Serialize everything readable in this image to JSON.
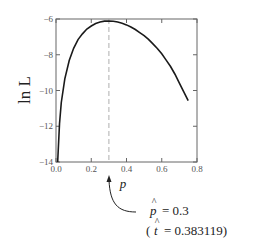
{
  "chart_data": {
    "type": "line",
    "title": "",
    "xlabel": "p",
    "ylabel": "ln L",
    "xlim": [
      0.0,
      0.8
    ],
    "ylim": [
      -14,
      -6
    ],
    "x_ticks": [
      "0.0",
      "0.2",
      "0.4",
      "0.6",
      "0.8"
    ],
    "y_ticks": [
      "-6",
      "-8",
      "-10",
      "-12",
      "-14"
    ],
    "grid": false,
    "legend": null,
    "series": [
      {
        "name": "ln L(p)",
        "x": [
          0.005,
          0.01,
          0.02,
          0.03,
          0.05,
          0.075,
          0.1,
          0.125,
          0.15,
          0.175,
          0.2,
          0.225,
          0.25,
          0.275,
          0.3,
          0.325,
          0.35,
          0.375,
          0.4,
          0.425,
          0.45,
          0.475,
          0.5,
          0.525,
          0.55,
          0.575,
          0.6,
          0.625,
          0.65,
          0.675,
          0.7,
          0.725,
          0.75
        ],
        "values": [
          -15.93,
          -13.89,
          -11.86,
          -10.67,
          -9.35,
          -8.32,
          -7.64,
          -7.15,
          -6.83,
          -6.56,
          -6.39,
          -6.25,
          -6.17,
          -6.12,
          -6.11,
          -6.13,
          -6.17,
          -6.24,
          -6.33,
          -6.45,
          -6.59,
          -6.76,
          -6.93,
          -7.14,
          -7.39,
          -7.65,
          -7.95,
          -8.3,
          -8.66,
          -9.09,
          -9.59,
          -10.08,
          -10.57
        ]
      }
    ],
    "annotations": [
      {
        "type": "vline",
        "x": 0.3,
        "style": "dashed"
      },
      {
        "type": "arrow-label",
        "text_line1_symbol": "p̂",
        "text_line1_value": "= 0.3",
        "text_line2_open": "(",
        "text_line2_symbol": "t̂",
        "text_line2_value": "= 0.383119)"
      }
    ]
  },
  "labels": {
    "ylabel_text": "ln L",
    "xlabel_text": "p",
    "ann_line1_symbol": "p",
    "ann_line1_value": "= 0.3",
    "ann_line2_open": "(",
    "ann_line2_symbol": "t",
    "ann_line2_value": "= 0.383119)",
    "hat": "^"
  },
  "ticks": {
    "x": [
      "0.0",
      "0.2",
      "0.4",
      "0.6",
      "0.8"
    ],
    "y": [
      "−6",
      "−8",
      "−10",
      "−12",
      "−14"
    ]
  },
  "colors": {
    "curve": "#1a1a1a",
    "frame": "#555555",
    "dashed": "#999999",
    "text": "#222222"
  }
}
